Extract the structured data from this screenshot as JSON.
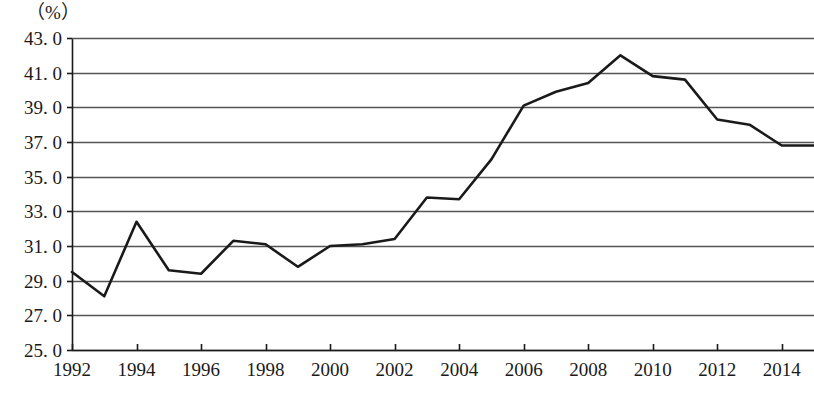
{
  "axis": {
    "unit_label": "（%）",
    "y_ticks": [
      "43. 0",
      "41. 0",
      "39. 0",
      "37. 0",
      "35. 0",
      "33. 0",
      "31. 0",
      "29. 0",
      "27. 0",
      "25. 0"
    ],
    "x_ticks": [
      "1992",
      "1994",
      "1996",
      "1998",
      "2000",
      "2002",
      "2004",
      "2006",
      "2008",
      "2010",
      "2012",
      "2014"
    ]
  },
  "style": {
    "line_color": "#1a1a1a",
    "grid_color": "#555555",
    "axis_color": "#1a1a1a",
    "background": "#ffffff"
  },
  "chart_data": {
    "type": "line",
    "title": "",
    "xlabel": "",
    "ylabel": "（%）",
    "xlim": [
      1992,
      2015
    ],
    "ylim": [
      25.0,
      43.0
    ],
    "ytick_values": [
      43.0,
      41.0,
      39.0,
      37.0,
      35.0,
      33.0,
      31.0,
      29.0,
      27.0,
      25.0
    ],
    "xtick_values": [
      1992,
      1994,
      1996,
      1998,
      2000,
      2002,
      2004,
      2006,
      2008,
      2010,
      2012,
      2014
    ],
    "grid": "horizontal",
    "legend": "none",
    "series": [
      {
        "name": "",
        "x": [
          1992,
          1993,
          1994,
          1995,
          1996,
          1997,
          1998,
          1999,
          2000,
          2001,
          2002,
          2003,
          2004,
          2005,
          2006,
          2007,
          2008,
          2009,
          2010,
          2011,
          2012,
          2013,
          2014,
          2015
        ],
        "values": [
          29.5,
          28.1,
          32.4,
          29.6,
          29.4,
          31.3,
          31.1,
          29.8,
          31.0,
          31.1,
          31.4,
          33.8,
          33.7,
          36.0,
          39.1,
          39.9,
          40.4,
          42.0,
          40.8,
          40.6,
          38.3,
          38.0,
          36.8,
          36.8
        ]
      }
    ]
  }
}
